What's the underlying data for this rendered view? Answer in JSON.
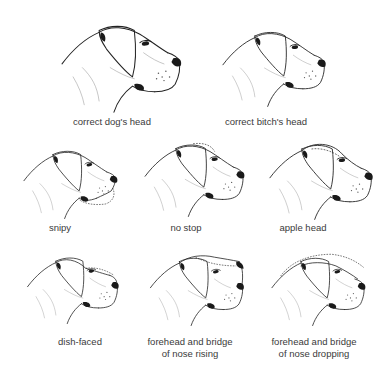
{
  "figure": {
    "panels": [
      {
        "id": "correct-dog",
        "caption_lines": [
          "correct dog's head"
        ],
        "x": 52,
        "y": 12,
        "w": 135,
        "h": 102,
        "cap_x": 112,
        "cap_y": 116,
        "variant": "correct",
        "scale": 1.0
      },
      {
        "id": "correct-bitch",
        "caption_lines": [
          "correct bitch's head"
        ],
        "x": 215,
        "y": 20,
        "w": 115,
        "h": 88,
        "cap_x": 266,
        "cap_y": 116,
        "variant": "correct",
        "scale": 0.86
      },
      {
        "id": "snipy",
        "caption_lines": [
          "snipy"
        ],
        "x": 14,
        "y": 140,
        "w": 110,
        "h": 80,
        "cap_x": 60,
        "cap_y": 222,
        "variant": "snipy",
        "scale": 0.82
      },
      {
        "id": "no-stop",
        "caption_lines": [
          "no stop"
        ],
        "x": 138,
        "y": 133,
        "w": 110,
        "h": 85,
        "cap_x": 186,
        "cap_y": 222,
        "variant": "nostop",
        "scale": 0.82
      },
      {
        "id": "apple-head",
        "caption_lines": [
          "apple head"
        ],
        "x": 262,
        "y": 133,
        "w": 115,
        "h": 88,
        "cap_x": 303,
        "cap_y": 222,
        "variant": "apple",
        "scale": 0.86
      },
      {
        "id": "dish-faced",
        "caption_lines": [
          "dish-faced"
        ],
        "x": 14,
        "y": 247,
        "w": 115,
        "h": 78,
        "cap_x": 80,
        "cap_y": 336,
        "variant": "dish",
        "scale": 0.84
      },
      {
        "id": "nose-rising",
        "caption_lines": [
          "forehead and bridge",
          "of nose rising"
        ],
        "x": 138,
        "y": 247,
        "w": 115,
        "h": 80,
        "cap_x": 190,
        "cap_y": 336,
        "variant": "rising",
        "scale": 0.84
      },
      {
        "id": "nose-dropping",
        "caption_lines": [
          "forehead and bridge",
          "of nose dropping"
        ],
        "x": 258,
        "y": 247,
        "w": 118,
        "h": 80,
        "cap_x": 314,
        "cap_y": 336,
        "variant": "dropping",
        "scale": 0.84
      }
    ]
  },
  "colors": {
    "line": "#222222",
    "caption": "#3a3a3a",
    "background": "#ffffff"
  }
}
